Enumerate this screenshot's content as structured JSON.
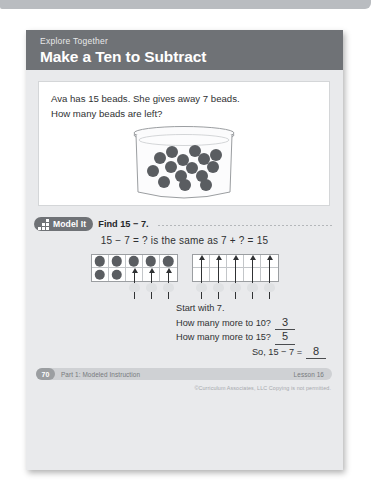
{
  "window": {
    "chrome_bar": "window-chrome"
  },
  "header": {
    "eyebrow": "Explore Together",
    "title": "Make a Ten to Subtract",
    "band_color": "#6f7276"
  },
  "problem": {
    "line1": "Ava has 15 beads. She gives away 7 beads.",
    "line2": "How many beads are left?",
    "illustration": "jar-of-beads",
    "bead_count": 15,
    "bead_color": "#5a5d61"
  },
  "model_it": {
    "icon": "grid-icon",
    "badge_label": "Model It",
    "task": "Find 15 − 7.",
    "equation": "15 − 7 = ? is the same as 7 + ? = 15"
  },
  "frames": {
    "left": {
      "name": "ten-frame-filled",
      "dots": 7,
      "arrows": 3,
      "counters": 3
    },
    "right": {
      "name": "ten-frame-empty",
      "dots": 0,
      "arrows": 5,
      "counters": 5
    }
  },
  "answers": {
    "start": "Start with 7.",
    "q1": "How many more to 10?",
    "a1": "3",
    "q2": "How many more to 15?",
    "a2": "5",
    "q3": "So, 15 − 7 =",
    "a3": "8"
  },
  "footer": {
    "page_number": "70",
    "part_label": "Part 1: Modeled Instruction",
    "lesson_label": "Lesson 16",
    "copyright": "©Curriculum Associates, LLC   Copying is not permitted."
  }
}
